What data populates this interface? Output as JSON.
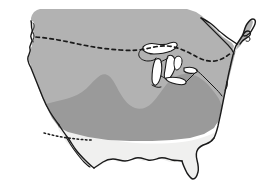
{
  "figure": {
    "name": "us-range-map",
    "type": "thematic-distribution-map",
    "region": "United States (contiguous)",
    "width": 266,
    "height": 185,
    "background_color": "#ffffff"
  },
  "colors": {
    "outline": "#1a1a1a",
    "land_unshaded": "#ffffff",
    "zone_light": "#f0f0ef",
    "zone_medium": "#b2b2b2",
    "zone_dark": "#9a9a9a",
    "lake_fill": "#ffffff",
    "dash_line": "#1a1a1a"
  },
  "layers": [
    {
      "id": "zone-medium",
      "label": "Primary shaded range",
      "fill": "#b2b2b2",
      "coverage": "Northern and central United States, extending from the Pacific Northwest across the northern plains to New England and down the eastern seaboard"
    },
    {
      "id": "zone-dark",
      "label": "Core shaded range",
      "fill": "#9a9a9a",
      "coverage": "Central band across the mid-latitude interior with two northward lobes"
    },
    {
      "id": "zone-light",
      "label": "Marginal shaded range",
      "fill": "#f0f0ef",
      "coverage": "Southwestern desert region and southern margin"
    }
  ],
  "boundaries": [
    {
      "id": "northern-dashed-boundary",
      "style": "dashed",
      "description": "Dashed line crossing the northern tier from the Pacific coast eastward to the Great Lakes and on toward the Atlantic"
    },
    {
      "id": "southwestern-dotted-boundary",
      "style": "dotted",
      "description": "Fine dotted line across the southwestern United States"
    }
  ],
  "water_features": [
    {
      "id": "lake-superior",
      "label": "Lake Superior"
    },
    {
      "id": "lake-michigan",
      "label": "Lake Michigan"
    },
    {
      "id": "lake-huron",
      "label": "Lake Huron"
    },
    {
      "id": "lake-erie",
      "label": "Lake Erie"
    },
    {
      "id": "lake-ontario",
      "label": "Lake Ontario"
    }
  ]
}
